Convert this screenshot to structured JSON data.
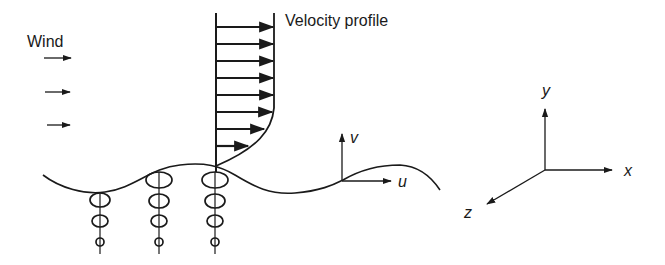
{
  "figure": {
    "title_labels": {
      "wind": "Wind",
      "velocity_profile": "Velocity profile"
    },
    "wave_velocity_axes": {
      "vertical": "v",
      "horizontal": "u"
    },
    "coordinate_axes": {
      "x": "x",
      "y": "y",
      "z": "z"
    },
    "wind_arrow_count": 3,
    "velocity_profile_arrow_count": 8,
    "orbit_columns": 3,
    "orbits_per_column": 4,
    "colors": {
      "ink": "#1a1a1a",
      "background": "#ffffff"
    }
  }
}
